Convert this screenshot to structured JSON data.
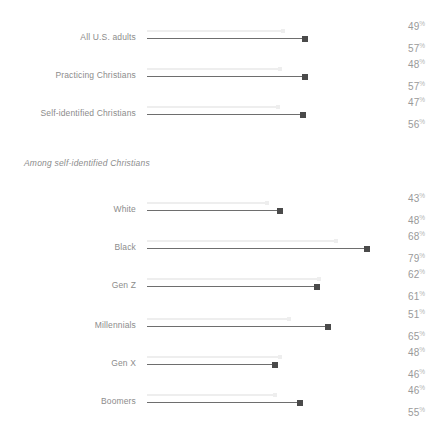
{
  "chart_data": {
    "type": "bar",
    "title": "",
    "subtitle": "",
    "xlabel": "",
    "ylabel": "",
    "xlim": [
      0,
      100
    ],
    "grid": false,
    "legend_position": "none",
    "orientation": "horizontal",
    "value_suffix": "%",
    "categories": [
      "All U.S. adults",
      "Practicing Christians",
      "Self-identified Christians",
      "White",
      "Black",
      "Gen Z",
      "Millennials",
      "Gen X",
      "Boomers"
    ],
    "series": [
      {
        "name": "first-value",
        "style": "light-line",
        "values": [
          49,
          48,
          47,
          43,
          68,
          62,
          51,
          48,
          46
        ]
      },
      {
        "name": "second-value",
        "style": "dark-line-with-marker",
        "values": [
          57,
          57,
          56,
          48,
          79,
          61,
          65,
          46,
          55
        ]
      }
    ],
    "group_subtitle": "Among self-identified Christians",
    "group_subtitle_before_index": 3
  },
  "rows": [
    {
      "label": "All U.S. adults",
      "top_value": "49",
      "bottom_value": "57",
      "light_pct": 49,
      "dark_pct": 57
    },
    {
      "label": "Practicing Christians",
      "top_value": "48",
      "bottom_value": "57",
      "light_pct": 48,
      "dark_pct": 57
    },
    {
      "label": "Self-identified Christians",
      "top_value": "47",
      "bottom_value": "56",
      "light_pct": 47,
      "dark_pct": 56
    },
    {
      "label": "White",
      "top_value": "43",
      "bottom_value": "48",
      "light_pct": 43,
      "dark_pct": 48
    },
    {
      "label": "Black",
      "top_value": "68",
      "bottom_value": "79",
      "light_pct": 68,
      "dark_pct": 79
    },
    {
      "label": "Gen Z",
      "top_value": "62",
      "bottom_value": "61",
      "light_pct": 62,
      "dark_pct": 61
    },
    {
      "label": "Millennials",
      "top_value": "51",
      "bottom_value": "65",
      "light_pct": 51,
      "dark_pct": 65
    },
    {
      "label": "Gen X",
      "top_value": "48",
      "bottom_value": "46",
      "light_pct": 48,
      "dark_pct": 46
    },
    {
      "label": "Boomers",
      "top_value": "46",
      "bottom_value": "55",
      "light_pct": 46,
      "dark_pct": 55
    }
  ],
  "group_subtitle": "Among self-identified Christians",
  "percent_symbol": "%",
  "colors": {
    "light_line": "#eeeeee",
    "dark_line": "#6e6e6e",
    "dark_marker": "#4a4a4a",
    "label_text": "#8c8c8c",
    "value_text": "#9a9a9a",
    "background": "#ffffff"
  },
  "layout": {
    "track_left_px": 147,
    "px_per_percent": 2.78,
    "row_tops_px": [
      18,
      56,
      94,
      190,
      228,
      266,
      306,
      344,
      382
    ],
    "subtitle_top_px": 158
  }
}
